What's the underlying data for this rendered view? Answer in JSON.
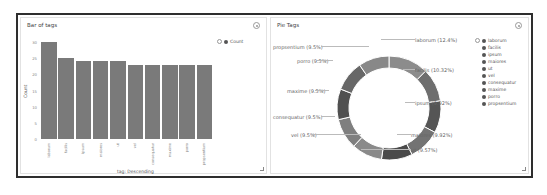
{
  "bar_panel": {
    "title": "Bar of tags",
    "legend": {
      "label": "Count"
    },
    "ylabel": "Count",
    "xlabel": "tag: Descending",
    "yticks": [
      "30",
      "25",
      "20",
      "15",
      "10",
      "5",
      "0"
    ]
  },
  "pie_panel": {
    "title": "Pie Tags",
    "legend": [
      "laborum",
      "facilis",
      "ipsum",
      "maiores",
      "ut",
      "vel",
      "consequatur",
      "maxime",
      "porro",
      "propsentium"
    ],
    "labels": {
      "laborum": "laborum (12.4%)",
      "facilis": "facilis (10.32%)",
      "ipsum": "ipsum (9.92%)",
      "maiores": "maiores (9.92%)",
      "ut": "ut (9.57%)",
      "vel": "vel (9.5%)",
      "consequatur": "consequatur (9.5%)",
      "maxime": "maxime (9.5%)",
      "porro": "porro (9.5%)",
      "propsentium": "propsentium (9.5%)"
    }
  },
  "chart_data": [
    {
      "type": "bar",
      "title": "Bar of tags",
      "xlabel": "tag: Descending",
      "ylabel": "Count",
      "ylim": [
        0,
        30
      ],
      "grid": false,
      "legend_position": "top-right",
      "categories": [
        "laborum",
        "facilis",
        "ipsum",
        "maiores",
        "ut",
        "vel",
        "consequatur",
        "maxime",
        "porro",
        "propsentium"
      ],
      "series": [
        {
          "name": "Count",
          "values": [
            30,
            25,
            24,
            24,
            24,
            23,
            23,
            23,
            23,
            23
          ]
        }
      ]
    },
    {
      "type": "pie",
      "title": "Pie Tags",
      "donut": true,
      "legend_position": "right",
      "categories": [
        "laborum",
        "facilis",
        "ipsum",
        "maiores",
        "ut",
        "vel",
        "consequatur",
        "maxime",
        "porro",
        "propsentium"
      ],
      "values": [
        12.4,
        10.32,
        9.92,
        9.92,
        9.57,
        9.5,
        9.5,
        9.5,
        9.5,
        9.5
      ]
    }
  ]
}
